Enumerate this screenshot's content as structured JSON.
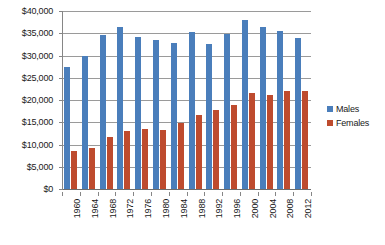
{
  "chart_data": {
    "type": "bar",
    "title": "",
    "xlabel": "",
    "ylabel": "",
    "grid": true,
    "legend_position": "right",
    "ylim": [
      0,
      40000
    ],
    "ytick_step": 5000,
    "ytick_labels": [
      "$40,000",
      "$35,000",
      "$30,000",
      "$25,000",
      "$20,000",
      "$15,000",
      "$10,000",
      "$5,000",
      "$0"
    ],
    "ytick_values": [
      40000,
      35000,
      30000,
      25000,
      20000,
      15000,
      10000,
      5000,
      0
    ],
    "categories": [
      "1960",
      "1964",
      "1968",
      "1972",
      "1976",
      "1980",
      "1984",
      "1988",
      "1992",
      "1996",
      "2000",
      "2004",
      "2008",
      "2012"
    ],
    "series": [
      {
        "name": "Males",
        "color": "#4a7ebb",
        "values": [
          27500,
          30000,
          34700,
          36500,
          34200,
          33500,
          32800,
          35300,
          32700,
          34900,
          38000,
          36300,
          35400,
          33900
        ]
      },
      {
        "name": "Females",
        "color": "#be4b2e",
        "values": [
          8500,
          9300,
          11700,
          13000,
          13400,
          13300,
          14800,
          16600,
          17700,
          18800,
          21600,
          21200,
          22100,
          22000
        ]
      }
    ]
  },
  "legend": {
    "items": [
      {
        "label": "Males",
        "color": "#4a7ebb"
      },
      {
        "label": "Females",
        "color": "#be4b2e"
      }
    ]
  }
}
